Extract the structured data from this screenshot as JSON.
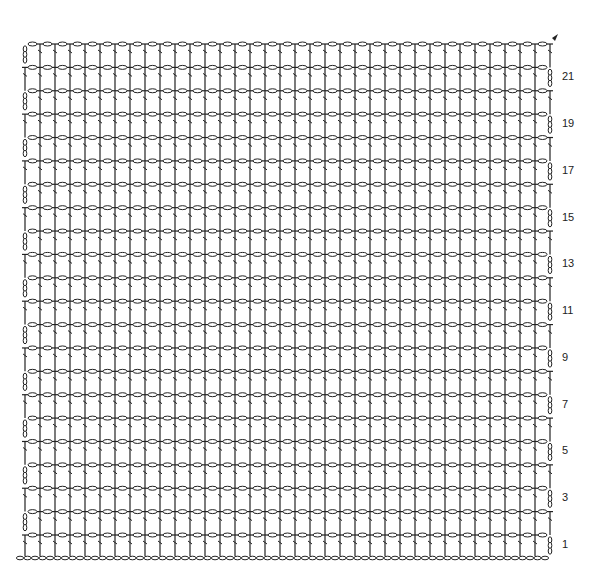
{
  "diagram": {
    "type": "crochet-chart",
    "stitch_columns": 36,
    "row_count": 22,
    "row_labels": [
      "1",
      "3",
      "5",
      "7",
      "9",
      "11",
      "13",
      "15",
      "17",
      "19",
      "21"
    ],
    "start_marker": "arrow-end-marker",
    "colors": {
      "ink": "#222222",
      "highlight": "#888888"
    }
  }
}
